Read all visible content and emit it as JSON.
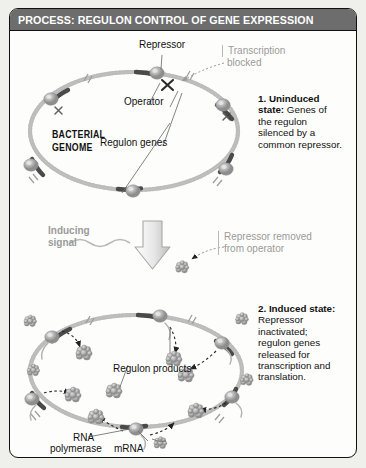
{
  "banner": {
    "title": "PROCESS: REGULON CONTROL OF GENE EXPRESSION"
  },
  "colors": {
    "banner_bg": "#6d6d6d",
    "banner_text": "#ffffff",
    "frame_border": "#111111",
    "page_bg": "#efefec",
    "figure_bg": "#fdfdfb",
    "gray_label": "#9a9a9a",
    "dna_strand": "#c9c9c9",
    "gene_segment": "#4a4a4a",
    "protein_blob": "#b0b0b0",
    "product_cluster": "#b5b5b5"
  },
  "panel_top": {
    "labels": {
      "repressor": "Repressor",
      "operator": "Operator",
      "regulon_genes": "Regulon genes",
      "bacterial_genome_line1": "BACTERIAL",
      "bacterial_genome_line2": "GENOME",
      "transcription_blocked_line1": "Transcription",
      "transcription_blocked_line2": "blocked"
    },
    "callout": {
      "number_title": "1. Uninduced state:",
      "body": " Genes of the regulon silenced by a common repressor."
    }
  },
  "transition": {
    "inducing_signal_line1": "Inducing",
    "inducing_signal_line2": "signal",
    "repressor_removed_line1": "Repressor removed",
    "repressor_removed_line2": "from operator"
  },
  "panel_bottom": {
    "labels": {
      "regulon_products": "Regulon products",
      "rna_line1": "RNA",
      "rna_line2": "polymerase",
      "mrna": "mRNA"
    },
    "callout": {
      "number_title": "2. Induced state:",
      "body": " Repressor inactivated; regulon genes released for transcription and translation."
    }
  },
  "icons": {
    "down_arrow": "down-arrow-icon",
    "blocked_x": "blocked-x-icon",
    "squiggle": "wavy-signal-icon"
  }
}
